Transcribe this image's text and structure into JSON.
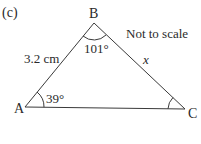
{
  "question": {
    "part_label": "(c)"
  },
  "diagram": {
    "type": "triangle",
    "note": "Not to scale",
    "stroke_color": "#3a3a3a",
    "vertices": [
      {
        "name": "A",
        "x": 25,
        "y": 107
      },
      {
        "name": "B",
        "x": 94,
        "y": 23
      },
      {
        "name": "C",
        "x": 185,
        "y": 109
      }
    ],
    "labels": {
      "A": "A",
      "B": "B",
      "C": "C"
    },
    "angles": {
      "A": "39°",
      "B": "101°",
      "C": ""
    },
    "sides": {
      "AB": "3.2 cm",
      "BC": "x",
      "AC": ""
    }
  }
}
